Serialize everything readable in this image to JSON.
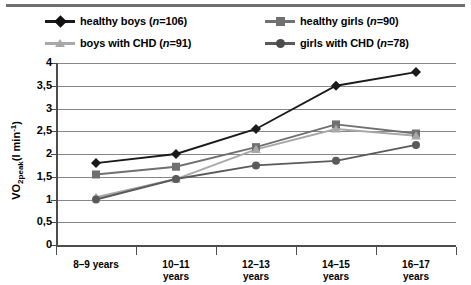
{
  "legend": {
    "items": [
      {
        "label_main": "healthy boys (",
        "label_n": "n",
        "label_tail": "=106)",
        "marker": "diamond",
        "color": "#1a1a1a",
        "name": "legend-healthy-boys"
      },
      {
        "label_main": "healthy girls (",
        "label_n": "n",
        "label_tail": "=90)",
        "marker": "square",
        "color": "#707070",
        "name": "legend-healthy-girls"
      },
      {
        "label_main": "boys with CHD (",
        "label_n": "n",
        "label_tail": "=91)",
        "marker": "triangle",
        "color": "#a8a8a8",
        "name": "legend-boys-chd"
      },
      {
        "label_main": "girls with CHD (",
        "label_n": "n",
        "label_tail": "=78)",
        "marker": "circle",
        "color": "#5a5a5a",
        "name": "legend-girls-chd"
      }
    ]
  },
  "axes": {
    "ylabel_main": "VO",
    "ylabel_sub": "2peak",
    "ylabel_unit": "(l min",
    "ylabel_sup": "-1",
    "ylabel_close": ")",
    "ytick_labels": [
      "4",
      "3,5",
      "3",
      "2,5",
      "2",
      "1,5",
      "1",
      "0,5",
      "0"
    ],
    "xtick_labels": [
      "8–9 years",
      "10–11 years",
      "12–13 years",
      "14–15 years",
      "16–17 years"
    ]
  },
  "chart_data": {
    "type": "line",
    "title": "",
    "xlabel": "",
    "ylabel": "VO2peak (l min-1)",
    "categories": [
      "8–9 years",
      "10–11 years",
      "12–13 years",
      "14–15 years",
      "16–17 years"
    ],
    "ylim": [
      0,
      4
    ],
    "ytick_values": [
      0,
      0.5,
      1,
      1.5,
      2,
      2.5,
      3,
      3.5,
      4
    ],
    "grid": true,
    "legend_position": "top",
    "series": [
      {
        "name": "healthy boys (n=106)",
        "n": 106,
        "marker": "diamond",
        "color": "#1a1a1a",
        "values": [
          1.8,
          2.0,
          2.55,
          3.5,
          3.8
        ]
      },
      {
        "name": "healthy girls (n=90)",
        "n": 90,
        "marker": "square",
        "color": "#707070",
        "values": [
          1.55,
          1.72,
          2.15,
          2.65,
          2.45
        ]
      },
      {
        "name": "boys with CHD (n=91)",
        "n": 91,
        "marker": "triangle",
        "color": "#a8a8a8",
        "values": [
          1.05,
          1.45,
          2.1,
          2.55,
          2.4
        ]
      },
      {
        "name": "girls with CHD (n=78)",
        "n": 78,
        "marker": "circle",
        "color": "#5a5a5a",
        "values": [
          1.0,
          1.45,
          1.75,
          1.85,
          2.2
        ]
      }
    ]
  }
}
